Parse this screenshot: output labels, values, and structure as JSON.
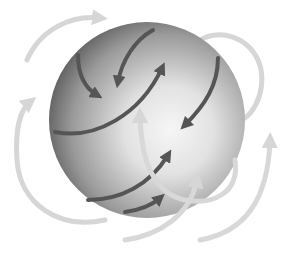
{
  "diagram": {
    "title": "",
    "colors": {
      "background": "#ffffff",
      "sphere_light": "#f4f4f4",
      "sphere_dark": "#5a5a5a",
      "inner_arrow": "#555555",
      "outer_arrow": "#d6d6d6"
    },
    "elements": {
      "sphere": {
        "label": "sphere"
      },
      "inner_arrows": [
        {
          "label": "inner-arrow-1"
        },
        {
          "label": "inner-arrow-2"
        },
        {
          "label": "inner-arrow-3"
        },
        {
          "label": "inner-arrow-4"
        },
        {
          "label": "inner-arrow-5"
        },
        {
          "label": "inner-arrow-6"
        }
      ],
      "outer_arrows": [
        {
          "label": "outer-arrow-top-left"
        },
        {
          "label": "outer-arrow-left"
        },
        {
          "label": "outer-arrow-right-loop"
        },
        {
          "label": "outer-arrow-center-loop"
        },
        {
          "label": "outer-arrow-bottom"
        },
        {
          "label": "outer-arrow-bottom-right"
        }
      ]
    }
  }
}
